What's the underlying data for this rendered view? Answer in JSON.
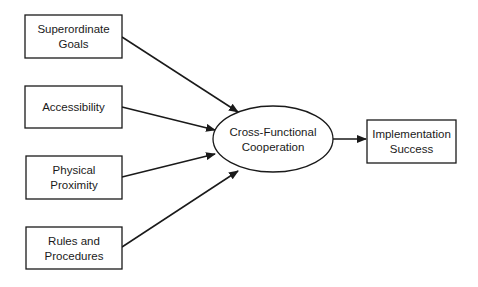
{
  "diagram": {
    "type": "flow",
    "colors": {
      "stroke": "#1a1a1a",
      "fill": "#ffffff",
      "text": "#1a1a1a"
    },
    "nodes": {
      "superordinate_goals": {
        "line1": "Superordinate",
        "line2": "Goals",
        "shape": "rectangle"
      },
      "accessibility": {
        "line1": "Accessibility",
        "shape": "rectangle"
      },
      "physical_proximity": {
        "line1": "Physical",
        "line2": "Proximity",
        "shape": "rectangle"
      },
      "rules_procedures": {
        "line1": "Rules and",
        "line2": "Procedures",
        "shape": "rectangle"
      },
      "cross_functional": {
        "line1": "Cross-Functional",
        "line2": "Cooperation",
        "shape": "ellipse"
      },
      "implementation": {
        "line1": "Implementation",
        "line2": "Success",
        "shape": "rectangle"
      }
    },
    "edges": [
      {
        "from": "Superordinate Goals",
        "to": "Cross-Functional Cooperation"
      },
      {
        "from": "Accessibility",
        "to": "Cross-Functional Cooperation"
      },
      {
        "from": "Physical Proximity",
        "to": "Cross-Functional Cooperation"
      },
      {
        "from": "Rules and Procedures",
        "to": "Cross-Functional Cooperation"
      },
      {
        "from": "Cross-Functional Cooperation",
        "to": "Implementation Success"
      }
    ]
  }
}
